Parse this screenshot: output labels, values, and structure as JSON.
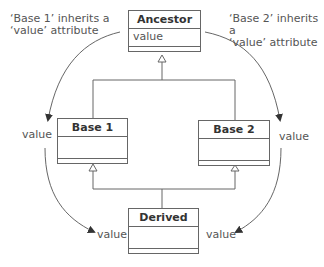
{
  "notes": {
    "left_line1": "‘Base 1’ inherits a",
    "left_line2": "‘value’ attribute",
    "right_line1": "‘Base 2’ inherits a",
    "right_line2": "‘value’ attribute"
  },
  "classes": {
    "ancestor": {
      "name": "Ancestor",
      "attribute": "value"
    },
    "base1": {
      "name": "Base 1",
      "attribute": ""
    },
    "base2": {
      "name": "Base 2",
      "attribute": ""
    },
    "derived": {
      "name": "Derived",
      "attribute": ""
    }
  },
  "labels": {
    "base1_value": "value",
    "base2_value": "value",
    "derived_left_value": "value",
    "derived_right_value": "value"
  },
  "colors": {
    "line": "#666666",
    "arrow": "#333333"
  }
}
